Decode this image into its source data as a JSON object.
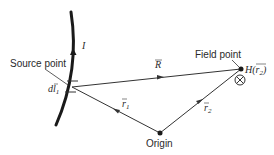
{
  "diagram": {
    "labels": {
      "source_point": "Source point",
      "field_point": "Field point",
      "origin": "Origin",
      "current": "I",
      "dl": "dl",
      "dl_sub": "1",
      "R": "R",
      "r1": "r",
      "r1_sub": "1",
      "r2": "r",
      "r2_sub": "2",
      "H_field": "H(r",
      "H_sub": "2",
      "H_close": ")",
      "into_page_symbol": "⊗"
    },
    "colors": {
      "wire": "#1a1a1a",
      "lines": "#333333",
      "text": "#2a2a2a"
    }
  }
}
